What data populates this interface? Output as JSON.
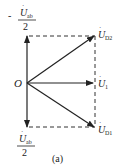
{
  "diagram": {
    "origin_label": "O",
    "vectors": [
      {
        "name": "U_D2",
        "label": "U",
        "subscript": "D2",
        "dot": true
      },
      {
        "name": "U_1",
        "label": "U",
        "subscript": "1",
        "dot": true
      },
      {
        "name": "U_D1",
        "label": "U",
        "subscript": "D1",
        "dot": true
      }
    ],
    "top_left": {
      "sign": "-",
      "numerator": "U",
      "numerator_sub": "ab",
      "denominator": "2"
    },
    "bottom_left": {
      "numerator": "U",
      "numerator_sub": "ab",
      "denominator": "2"
    },
    "caption": "(a)",
    "colors": {
      "line": "#222222",
      "background": "#ffffff"
    }
  }
}
